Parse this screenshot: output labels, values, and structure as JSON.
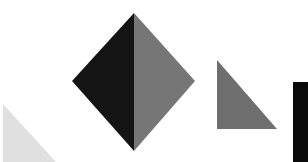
{
  "canvas": {
    "width": 308,
    "height": 162,
    "background": "#ffffff"
  },
  "shapes": [
    {
      "name": "light-triangle",
      "type": "polygon",
      "points": "3,104 3,162 56,162",
      "fill": "#e0e0e0"
    },
    {
      "name": "diamond-left-half",
      "type": "polygon",
      "points": "134,13 72,81 134,151",
      "fill": "#141414"
    },
    {
      "name": "diamond-right-half",
      "type": "polygon",
      "points": "134,13 195,81 134,151",
      "fill": "#767676"
    },
    {
      "name": "grey-right-triangle",
      "type": "polygon",
      "points": "217,60 217,129 277,129",
      "fill": "#6e6e6e"
    },
    {
      "name": "black-rectangle",
      "type": "rect",
      "x": 293,
      "y": 82,
      "width": 15,
      "height": 80,
      "fill": "#0a0a0a"
    }
  ]
}
